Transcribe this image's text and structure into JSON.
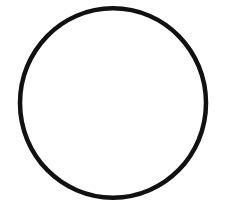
{
  "canvas": {
    "width": 230,
    "height": 216,
    "background_color": "#ffffff",
    "alt_text": "Black circle outline on a white background"
  },
  "figure": {
    "name": "circle-outline",
    "shape_type": "ellipse",
    "stroke_color": "#111111",
    "fill_color": "none",
    "stroke_width": 4.5,
    "center_x": 113,
    "center_y": 103,
    "radius_x": 93,
    "radius_y": 95,
    "bounds": {
      "left": 20,
      "top": 8,
      "right": 206,
      "bottom": 198,
      "width": 186,
      "height": 190
    },
    "path": "M 113 8.3 C 164.5 8.3 206 50.8 206 103 C 206 155.2 164.5 197.7 113 197.7 C 61.5 197.7 20 155.2 20 103 C 20 50.8 61.5 8.3 113 8.3 Z"
  }
}
